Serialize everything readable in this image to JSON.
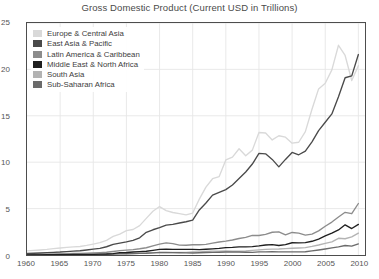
{
  "chart_data": {
    "type": "line",
    "title": "Gross Domestic Product (Current USD in Trillions)",
    "xlabel": "",
    "ylabel": "",
    "xlim": [
      1960,
      2011
    ],
    "ylim": [
      0,
      25
    ],
    "yticks": [
      0,
      5,
      10,
      15,
      20,
      25
    ],
    "xticks": [
      1960,
      1965,
      1970,
      1975,
      1980,
      1985,
      1990,
      1995,
      2000,
      2005,
      2010
    ],
    "grid": true,
    "legend_position": "upper-left-inside",
    "x": [
      1960,
      1961,
      1962,
      1963,
      1964,
      1965,
      1966,
      1967,
      1968,
      1969,
      1970,
      1971,
      1972,
      1973,
      1974,
      1975,
      1976,
      1977,
      1978,
      1979,
      1980,
      1981,
      1982,
      1983,
      1984,
      1985,
      1986,
      1987,
      1988,
      1989,
      1990,
      1991,
      1992,
      1993,
      1994,
      1995,
      1996,
      1997,
      1998,
      1999,
      2000,
      2001,
      2002,
      2003,
      2004,
      2005,
      2006,
      2007,
      2008,
      2009,
      2010
    ],
    "series": [
      {
        "name": "Europe & Central Asia",
        "color": "#d9d9d9",
        "values": [
          0.45,
          0.49,
          0.54,
          0.6,
          0.68,
          0.75,
          0.82,
          0.88,
          0.92,
          1.03,
          1.18,
          1.33,
          1.58,
          2.0,
          2.25,
          2.62,
          2.75,
          3.17,
          3.95,
          4.72,
          5.22,
          4.78,
          4.58,
          4.45,
          4.32,
          4.52,
          6.02,
          7.32,
          8.22,
          8.45,
          10.25,
          10.55,
          11.45,
          10.7,
          11.3,
          13.2,
          13.15,
          12.4,
          12.85,
          12.7,
          12.05,
          12.15,
          13.3,
          15.7,
          17.9,
          18.5,
          19.95,
          22.6,
          21.5,
          18.8,
          20.4
        ]
      },
      {
        "name": "East Asia & Pacific",
        "color": "#4a4a4a",
        "values": [
          0.16,
          0.19,
          0.22,
          0.25,
          0.29,
          0.32,
          0.37,
          0.41,
          0.46,
          0.54,
          0.63,
          0.71,
          0.89,
          1.15,
          1.28,
          1.42,
          1.58,
          1.85,
          2.45,
          2.72,
          2.95,
          3.22,
          3.3,
          3.45,
          3.58,
          3.75,
          4.85,
          5.6,
          6.45,
          6.75,
          7.05,
          7.55,
          8.25,
          8.95,
          9.8,
          10.95,
          10.9,
          10.3,
          9.5,
          10.3,
          11.05,
          10.8,
          11.2,
          12.2,
          13.4,
          14.3,
          15.2,
          17.05,
          19.1,
          19.3,
          21.6
        ]
      },
      {
        "name": "Latin America & Caribbean",
        "color": "#8c8c8c",
        "values": [
          0.08,
          0.09,
          0.09,
          0.1,
          0.12,
          0.13,
          0.15,
          0.16,
          0.18,
          0.2,
          0.23,
          0.26,
          0.3,
          0.38,
          0.47,
          0.52,
          0.58,
          0.67,
          0.78,
          0.98,
          1.18,
          1.3,
          1.22,
          1.06,
          1.05,
          1.1,
          1.1,
          1.15,
          1.28,
          1.4,
          1.5,
          1.62,
          1.78,
          1.9,
          2.12,
          2.1,
          2.22,
          2.45,
          2.5,
          2.18,
          2.43,
          2.35,
          2.15,
          2.25,
          2.6,
          3.1,
          3.55,
          4.1,
          4.6,
          4.45,
          5.55
        ]
      },
      {
        "name": "Middle East & North Africa",
        "color": "#1f1f1f",
        "values": [
          0.02,
          0.02,
          0.02,
          0.03,
          0.03,
          0.04,
          0.04,
          0.05,
          0.05,
          0.06,
          0.07,
          0.09,
          0.11,
          0.15,
          0.25,
          0.27,
          0.32,
          0.37,
          0.4,
          0.5,
          0.6,
          0.62,
          0.6,
          0.6,
          0.6,
          0.6,
          0.58,
          0.62,
          0.66,
          0.71,
          0.8,
          0.82,
          0.88,
          0.88,
          0.9,
          0.98,
          1.08,
          1.12,
          1.02,
          1.12,
          1.32,
          1.3,
          1.33,
          1.48,
          1.72,
          2.05,
          2.35,
          2.7,
          3.25,
          2.85,
          3.3
        ]
      },
      {
        "name": "South Asia",
        "color": "#b3b3b3",
        "values": [
          0.05,
          0.05,
          0.05,
          0.06,
          0.07,
          0.07,
          0.07,
          0.08,
          0.08,
          0.09,
          0.1,
          0.1,
          0.11,
          0.13,
          0.15,
          0.16,
          0.16,
          0.19,
          0.21,
          0.23,
          0.25,
          0.26,
          0.27,
          0.29,
          0.29,
          0.32,
          0.34,
          0.38,
          0.42,
          0.42,
          0.45,
          0.41,
          0.42,
          0.43,
          0.49,
          0.55,
          0.6,
          0.63,
          0.65,
          0.69,
          0.73,
          0.76,
          0.8,
          0.93,
          1.08,
          1.25,
          1.42,
          1.8,
          1.75,
          1.95,
          2.35
        ]
      },
      {
        "name": "Sub-Saharan Africa",
        "color": "#6b6b6b",
        "values": [
          0.03,
          0.03,
          0.03,
          0.04,
          0.04,
          0.04,
          0.05,
          0.05,
          0.05,
          0.06,
          0.07,
          0.07,
          0.08,
          0.1,
          0.13,
          0.14,
          0.15,
          0.17,
          0.19,
          0.23,
          0.28,
          0.27,
          0.25,
          0.24,
          0.23,
          0.22,
          0.24,
          0.27,
          0.29,
          0.3,
          0.32,
          0.32,
          0.32,
          0.3,
          0.29,
          0.33,
          0.34,
          0.35,
          0.33,
          0.33,
          0.34,
          0.33,
          0.35,
          0.44,
          0.54,
          0.65,
          0.76,
          0.88,
          1.02,
          0.95,
          1.2
        ]
      }
    ]
  }
}
